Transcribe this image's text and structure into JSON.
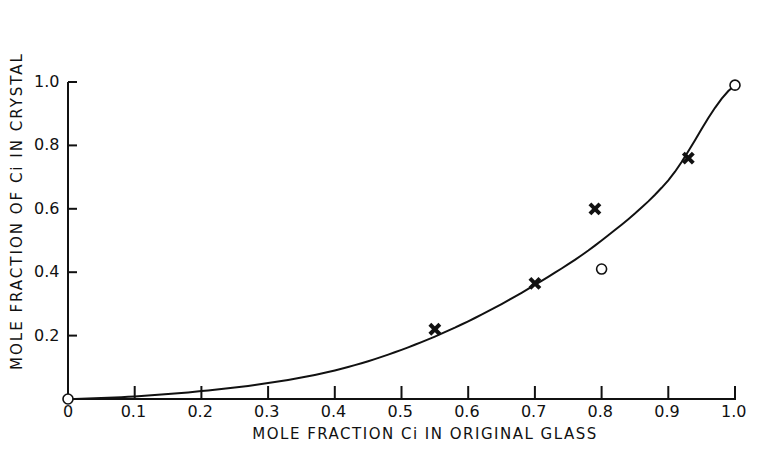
{
  "chart_data": {
    "type": "scatter",
    "title": "",
    "xlabel": "MOLE FRACTION Ci IN ORIGINAL GLASS",
    "ylabel": "MOLE FRACTION OF Ci IN CRYSTAL",
    "xlim": [
      0,
      1.0
    ],
    "ylim": [
      0,
      1.0
    ],
    "xticks": [
      "0",
      "0.1",
      "0.2",
      "0.3",
      "0.4",
      "0.5",
      "0.6",
      "0.7",
      "0.8",
      "0.9",
      "1.0"
    ],
    "yticks": [
      "0.2",
      "0.4",
      "0.6",
      "0.8",
      "1.0"
    ],
    "grid": false,
    "legend": null,
    "series": [
      {
        "name": "crosses",
        "marker": "x",
        "points": [
          [
            0.55,
            0.22
          ],
          [
            0.7,
            0.365
          ],
          [
            0.79,
            0.6
          ],
          [
            0.93,
            0.76
          ]
        ]
      },
      {
        "name": "open circles",
        "marker": "o",
        "points": [
          [
            0.0,
            0.0
          ],
          [
            0.8,
            0.41
          ],
          [
            1.0,
            0.99
          ]
        ]
      },
      {
        "name": "fitted curve",
        "type": "line",
        "points": [
          [
            0.0,
            0.0
          ],
          [
            0.1,
            0.008
          ],
          [
            0.2,
            0.025
          ],
          [
            0.3,
            0.05
          ],
          [
            0.4,
            0.09
          ],
          [
            0.5,
            0.155
          ],
          [
            0.6,
            0.245
          ],
          [
            0.7,
            0.36
          ],
          [
            0.8,
            0.5
          ],
          [
            0.9,
            0.69
          ],
          [
            1.0,
            0.99
          ]
        ]
      }
    ]
  }
}
